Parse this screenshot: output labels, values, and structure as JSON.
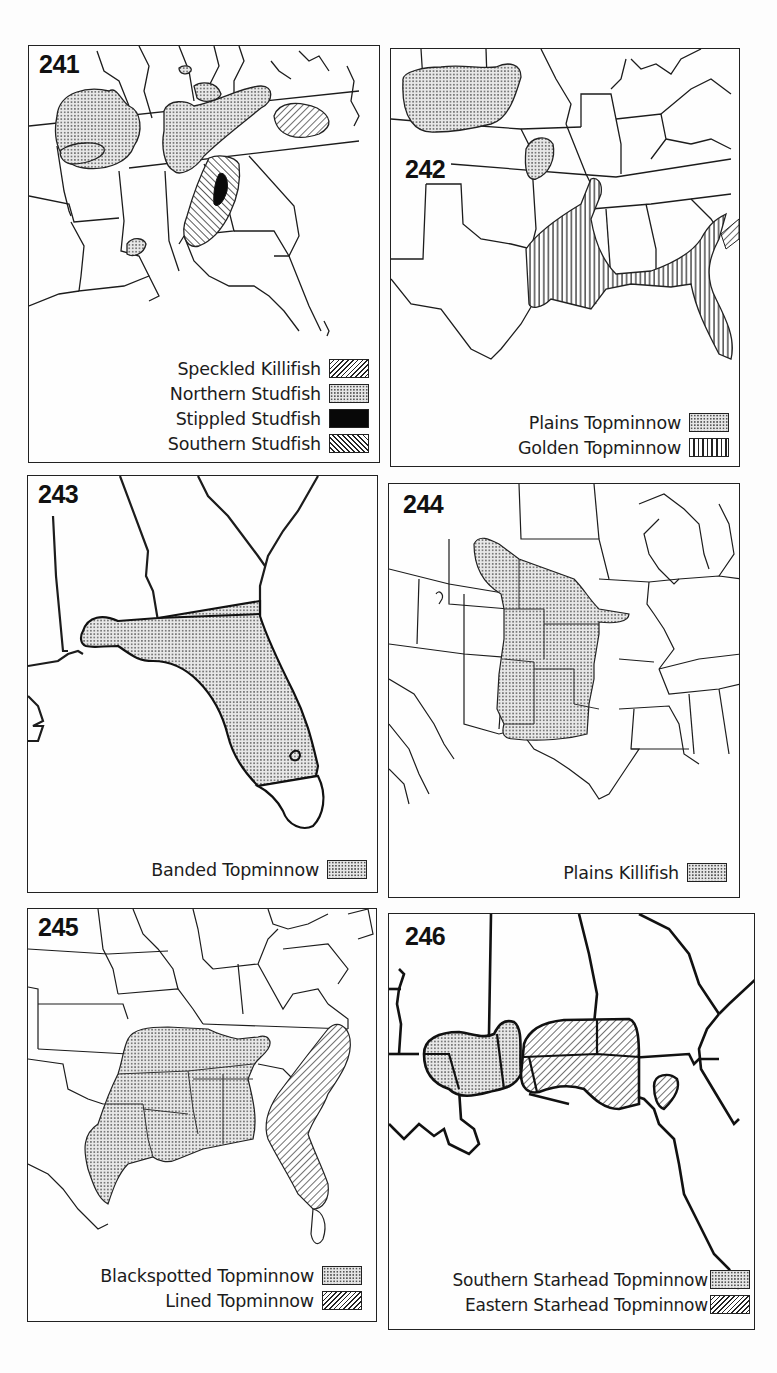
{
  "panels": [
    {
      "number": "241",
      "legend": [
        {
          "label": "Speckled Killifish",
          "pattern": "diagonal-forward-hatch"
        },
        {
          "label": "Northern Studfish",
          "pattern": "stipple-dots"
        },
        {
          "label": "Stippled Studfish",
          "pattern": "solid-black"
        },
        {
          "label": "Southern Studfish",
          "pattern": "diagonal-back-hatch"
        }
      ]
    },
    {
      "number": "242",
      "legend": [
        {
          "label": "Plains Topminnow",
          "pattern": "stipple-dots"
        },
        {
          "label": "Golden Topminnow",
          "pattern": "vertical-lines"
        }
      ]
    },
    {
      "number": "243",
      "legend": [
        {
          "label": "Banded Topminnow",
          "pattern": "stipple-dots"
        }
      ]
    },
    {
      "number": "244",
      "legend": [
        {
          "label": "Plains Killifish",
          "pattern": "stipple-dots"
        }
      ]
    },
    {
      "number": "245",
      "legend": [
        {
          "label": "Blackspotted Topminnow",
          "pattern": "stipple-dots"
        },
        {
          "label": "Lined Topminnow",
          "pattern": "diagonal-forward-hatch"
        }
      ]
    },
    {
      "number": "246",
      "legend": [
        {
          "label": "Southern Starhead Topminnow",
          "pattern": "stipple-dots"
        },
        {
          "label": "Eastern Starhead Topminnow",
          "pattern": "diagonal-forward-hatch"
        }
      ]
    }
  ],
  "colors": {
    "ink": "#1a1a1a",
    "stipple_fill": "#e0e0e0",
    "paper": "#fdfdfd"
  }
}
